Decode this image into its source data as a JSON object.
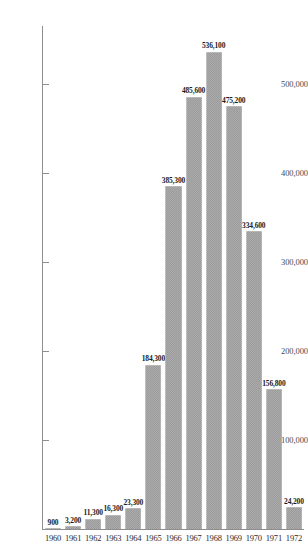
{
  "chart_data": {
    "type": "bar",
    "title": "",
    "subtitle": "",
    "xlabel": "",
    "ylabel": "",
    "categories": [
      "1960",
      "1961",
      "1962",
      "1963",
      "1964",
      "1965",
      "1966",
      "1967",
      "1968",
      "1969",
      "1970",
      "1971",
      "1972"
    ],
    "values": [
      900,
      3200,
      11300,
      16300,
      23300,
      184300,
      385300,
      485600,
      536100,
      475200,
      334600,
      156800,
      24200
    ],
    "value_labels": [
      "900",
      "3,200",
      "11,300",
      "16,300",
      "23,300",
      "184,300",
      "385,300",
      "485,600",
      "536,100",
      "475,200",
      "334,600",
      "156,800",
      "24,200"
    ],
    "ytick_values": [
      100000,
      200000,
      300000,
      400000,
      500000
    ],
    "ytick_labels": [
      "100,000",
      "200,000",
      "300,000",
      "400,000",
      "500,000"
    ],
    "ylim": [
      0,
      580000
    ],
    "grid": false,
    "legend": false,
    "legend_position": "none",
    "series": [
      {
        "name": "",
        "values": [
          900,
          3200,
          11300,
          16300,
          23300,
          184300,
          385300,
          485600,
          536100,
          475200,
          334600,
          156800,
          24200
        ]
      }
    ],
    "bar_color": "#9b9b9b",
    "axis_color": "#8e8e8e",
    "text_color": "#1c1c1c"
  }
}
